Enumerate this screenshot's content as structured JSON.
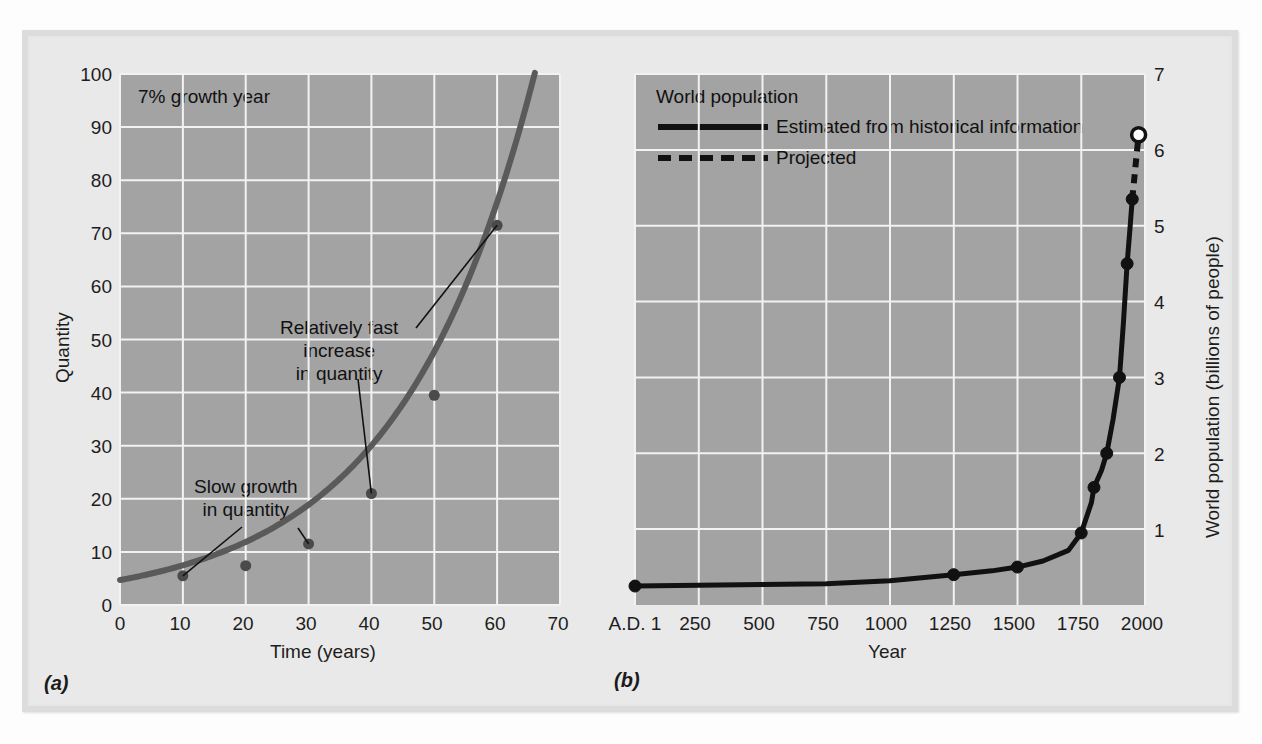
{
  "figure": {
    "background_color": "#e9e9e9",
    "plot_background_color": "#a3a3a3",
    "gridline_color": "#f2f2f2"
  },
  "panel_a": {
    "subfig_label": "(a)",
    "curve_color": "#5a5a5a",
    "inchart_title": "7% growth year",
    "annotations": [
      {
        "id": "slow-growth",
        "lines": "Slow growth\nin quantity"
      },
      {
        "id": "fast-increase",
        "lines": "Relatively fast\nincrease\nin quantity"
      }
    ]
  },
  "panel_b": {
    "subfig_label": "(b)",
    "curve_color": "#111111",
    "inchart_title": "World population",
    "legend": [
      {
        "style": "solid",
        "label": "Estimated from historical information"
      },
      {
        "style": "dashed",
        "label": "Projected"
      }
    ]
  },
  "chart_data": [
    {
      "id": "a",
      "type": "line",
      "title": "7% growth year",
      "xlabel": "Time (years)",
      "ylabel": "Quantity",
      "xlim": [
        0,
        70
      ],
      "ylim": [
        0,
        100
      ],
      "xticks": [
        "0",
        "10",
        "20",
        "30",
        "40",
        "50",
        "60",
        "70"
      ],
      "yticks": [
        "0",
        "10",
        "20",
        "30",
        "40",
        "50",
        "60",
        "70",
        "80",
        "90",
        "100"
      ],
      "grid": true,
      "legend": "none",
      "x": [
        0,
        10,
        20,
        30,
        40,
        50,
        60,
        65
      ],
      "y": [
        4.7,
        5.5,
        7.4,
        11.5,
        21.0,
        39.5,
        71.5,
        100
      ],
      "markers_x": [
        10,
        20,
        30,
        40,
        50,
        60
      ],
      "markers_y": [
        5.5,
        7.4,
        11.5,
        21.0,
        39.5,
        71.5
      ],
      "annotations": [
        {
          "text": "Slow growth\nin quantity",
          "points_to": [
            [
              10,
              5.5
            ],
            [
              30,
              11.5
            ]
          ]
        },
        {
          "text": "Relatively fast\nincrease\nin quantity",
          "points_to": [
            [
              40,
              21.0
            ],
            [
              60,
              71.5
            ]
          ]
        }
      ]
    },
    {
      "id": "b",
      "type": "line",
      "title": "World population",
      "xlabel": "Year",
      "ylabel": "World population (billions of people)",
      "xlim": [
        1,
        2000
      ],
      "ylim": [
        0,
        7
      ],
      "xticks": [
        "A.D. 1",
        "250",
        "500",
        "750",
        "1000",
        "1250",
        "1500",
        "1750",
        "2000"
      ],
      "yticks": [
        "1",
        "2",
        "3",
        "4",
        "5",
        "6",
        "7"
      ],
      "grid": true,
      "legend": "inside-top-left",
      "series": [
        {
          "name": "Estimated from historical information",
          "style": "solid",
          "x": [
            1,
            250,
            1000,
            1250,
            1500,
            1750,
            1800,
            1850,
            1900,
            1925,
            1950,
            1960
          ],
          "y": [
            0.25,
            0.26,
            0.3,
            0.4,
            0.5,
            0.8,
            1.0,
            1.3,
            1.65,
            2.0,
            2.55,
            3.05
          ]
        },
        {
          "name": "Projected",
          "style": "dashed",
          "x": [
            1960,
            1975
          ],
          "y": [
            5.3,
            6.2
          ]
        }
      ],
      "markers": [
        {
          "x": 1,
          "y": 0.25,
          "fill": "solid"
        },
        {
          "x": 1250,
          "y": 0.4,
          "fill": "solid"
        },
        {
          "x": 1500,
          "y": 0.5,
          "fill": "solid"
        },
        {
          "x": 1750,
          "y": 0.95,
          "fill": "solid"
        },
        {
          "x": 1800,
          "y": 1.55,
          "fill": "solid"
        },
        {
          "x": 1850,
          "y": 2.0,
          "fill": "solid"
        },
        {
          "x": 1900,
          "y": 3.0,
          "fill": "solid"
        },
        {
          "x": 1930,
          "y": 4.5,
          "fill": "solid"
        },
        {
          "x": 1950,
          "y": 5.35,
          "fill": "solid"
        },
        {
          "x": 1975,
          "y": 6.2,
          "fill": "open"
        }
      ]
    }
  ]
}
